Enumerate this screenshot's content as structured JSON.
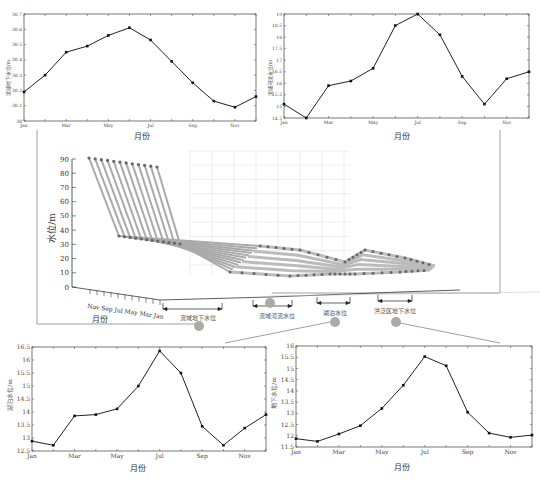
{
  "chart_data": [
    {
      "id": "tl",
      "type": "line",
      "title": "",
      "xlabel": "月份",
      "ylabel": "流域地下水位/m",
      "categories": [
        "Jan",
        "Feb",
        "Mar",
        "Apr",
        "May",
        "Jun",
        "Jul",
        "Aug",
        "Sep",
        "Oct",
        "Nov",
        "Dec"
      ],
      "xtick_labels": [
        "Jan",
        "Mar",
        "May",
        "Jul",
        "Sep",
        "Nov"
      ],
      "values": [
        30.19,
        30.3,
        30.45,
        30.49,
        30.56,
        30.61,
        30.53,
        30.39,
        30.25,
        30.13,
        30.09,
        30.16
      ],
      "ylim": [
        30,
        30.7
      ],
      "yticks": [
        "30",
        "30.1",
        "30.2",
        "30.3",
        "30.4",
        "30.5",
        "30.6",
        "30.7"
      ],
      "grid": false
    },
    {
      "id": "tr",
      "type": "line",
      "title": "",
      "xlabel": "月份",
      "ylabel": "流域河流水位/m",
      "categories": [
        "Jan",
        "Feb",
        "Mar",
        "Apr",
        "May",
        "Jun",
        "Jul",
        "Aug",
        "Sep",
        "Oct",
        "Nov",
        "Dec"
      ],
      "xtick_labels": [
        "Jan",
        "Mar",
        "May",
        "Jul",
        "Sep",
        "Nov"
      ],
      "values": [
        15.1,
        14.5,
        15.9,
        16.1,
        16.65,
        18.5,
        19.0,
        18.1,
        16.3,
        15.1,
        16.2,
        16.5
      ],
      "ylim": [
        14.5,
        19
      ],
      "yticks": [
        "14.5",
        "15",
        "15.5",
        "16",
        "16.5",
        "17",
        "17.5",
        "18",
        "18.5",
        "19"
      ],
      "grid": false
    },
    {
      "id": "3d",
      "type": "line",
      "title": "",
      "zlabel": "水位/m",
      "ylabel": "月份",
      "zlim": [
        0,
        90
      ],
      "zticks": [
        "0",
        "10",
        "20",
        "30",
        "40",
        "50",
        "60",
        "70",
        "80",
        "90"
      ],
      "month_ticks": [
        "Nov",
        "Sep",
        "Jul",
        "May",
        "Mar",
        "Jan"
      ],
      "groups": [
        "流域地下水位",
        "流域河流水位",
        "湖泊水位",
        "洪泛区地下水位"
      ],
      "series_levels": [
        {
          "name": "top_ridge",
          "approx_value": 85
        },
        {
          "name": "lower_ridge",
          "approx_value": 30
        }
      ],
      "grid": true
    },
    {
      "id": "bl",
      "type": "line",
      "title": "",
      "xlabel": "月份",
      "ylabel": "湖泊水位/m",
      "categories": [
        "Jan",
        "Feb",
        "Mar",
        "Apr",
        "May",
        "Jun",
        "Jul",
        "Aug",
        "Sep",
        "Oct",
        "Nov",
        "Dec"
      ],
      "xtick_labels": [
        "Jan",
        "Mar",
        "May",
        "Jul",
        "Sep",
        "Nov"
      ],
      "values": [
        12.88,
        12.72,
        13.85,
        13.9,
        14.12,
        15.0,
        16.35,
        15.5,
        13.45,
        12.72,
        13.38,
        13.9
      ],
      "ylim": [
        12.5,
        16.5
      ],
      "yticks": [
        "12.5",
        "13",
        "13.5",
        "14",
        "14.5",
        "15",
        "15.5",
        "16",
        "16.5"
      ],
      "grid": false
    },
    {
      "id": "br",
      "type": "line",
      "title": "",
      "xlabel": "月份",
      "ylabel": "地下水位/m",
      "categories": [
        "Jan",
        "Feb",
        "Mar",
        "Apr",
        "May",
        "Jun",
        "Jul",
        "Aug",
        "Sep",
        "Oct",
        "Nov",
        "Dec"
      ],
      "xtick_labels": [
        "Jan",
        "Mar",
        "May",
        "Jul",
        "Sep",
        "Nov"
      ],
      "values": [
        11.87,
        11.75,
        12.08,
        12.45,
        13.22,
        14.25,
        15.53,
        15.12,
        13.05,
        12.12,
        11.93,
        12.03
      ],
      "ylim": [
        11.5,
        16
      ],
      "yticks": [
        "11.5",
        "12",
        "12.5",
        "13",
        "13.5",
        "14",
        "14.5",
        "15",
        "15.5",
        "16"
      ],
      "grid": false
    }
  ],
  "labels": {
    "tl_xlabel": "月份",
    "tr_xlabel": "月份",
    "bl_xlabel": "月份",
    "br_xlabel": "月份",
    "tl_ylabel": "流域地下水位/m",
    "tr_ylabel": "流域河流水位/m",
    "bl_ylabel": "湖泊水位/m",
    "br_ylabel": "地下水位/m",
    "d3_zlabel": "水位/m",
    "d3_month_label": "月份",
    "d3_month_ticks": "Nov Sep Jul May Mar Jan",
    "group1": "流域地下水位",
    "group2": "流域河流水位",
    "group3": "湖泊水位",
    "group4": "洪泛区地下水位"
  },
  "colors": {
    "line": "#222222",
    "marker": "#111111",
    "axis": "#555555",
    "surface": "#aaaaaa",
    "callout": "#999999"
  }
}
